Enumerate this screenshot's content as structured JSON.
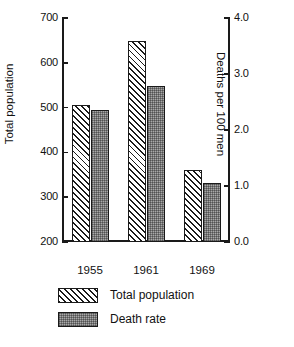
{
  "chart_data": {
    "type": "bar",
    "title": "",
    "subtitle": "",
    "xlabel": "",
    "ylabel": "Total population",
    "y2label": "Deaths per 100 men",
    "categories": [
      "1955",
      "1961",
      "1969"
    ],
    "series": [
      {
        "name": "Total population",
        "axis": "left",
        "pattern": "diagonal-hatch",
        "values": [
          505,
          648,
          360
        ]
      },
      {
        "name": "Death rate",
        "axis": "right",
        "pattern": "gray-stipple",
        "values": [
          2.35,
          2.78,
          1.05
        ]
      }
    ],
    "ylim": [
      200,
      700
    ],
    "yticks": [
      "200",
      "300",
      "400",
      "500",
      "600",
      "700"
    ],
    "y2lim": [
      0.0,
      4.0
    ],
    "y2ticks": [
      "0.0",
      "1.0",
      "2.0",
      "3.0",
      "4.0"
    ],
    "grid": false,
    "legend_position": "bottom-left",
    "legend": [
      "Total population",
      "Death rate"
    ],
    "colors": {
      "axis": "#1a1a1a",
      "hatch": "#1a1a1a",
      "stipple_fill": "#a8a8a8",
      "background": "#ffffff"
    }
  },
  "axes": {
    "left": {
      "title": "Total population",
      "ticks": [
        {
          "label": "700",
          "value": 700
        },
        {
          "label": "600",
          "value": 600
        },
        {
          "label": "500",
          "value": 500
        },
        {
          "label": "400",
          "value": 400
        },
        {
          "label": "300",
          "value": 300
        },
        {
          "label": "200",
          "value": 200
        }
      ]
    },
    "right": {
      "title": "Deaths per 100 men",
      "ticks": [
        {
          "label": "4.0",
          "value": 4.0
        },
        {
          "label": "3.0",
          "value": 3.0
        },
        {
          "label": "2.0",
          "value": 2.0
        },
        {
          "label": "1.0",
          "value": 1.0
        },
        {
          "label": "0.0",
          "value": 0.0
        }
      ]
    }
  },
  "legend": {
    "items": [
      {
        "label": "Total population",
        "pattern": "diagonal-hatch"
      },
      {
        "label": "Death rate",
        "pattern": "gray-stipple"
      }
    ]
  }
}
